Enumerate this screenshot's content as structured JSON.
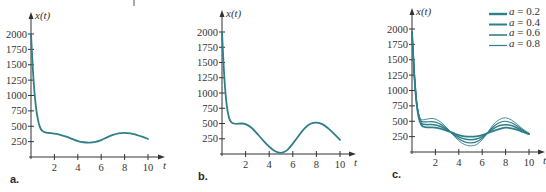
{
  "chart_data": [
    {
      "type": "line",
      "panel_label": "a.",
      "xlabel": "t",
      "ylabel": "x(t)",
      "xticks": [
        2,
        4,
        6,
        8,
        10
      ],
      "yticks": [
        250,
        500,
        750,
        1000,
        1250,
        1500,
        1750,
        2000
      ],
      "xlim": [
        0,
        10
      ],
      "ylim": [
        0,
        2000
      ],
      "grid": false,
      "series": [
        {
          "name": "x(t)",
          "x": [
            0,
            0.2,
            0.4,
            0.6,
            0.8,
            1.0,
            1.3,
            1.6,
            2.0,
            2.5,
            3.0,
            3.5,
            4.0,
            4.5,
            5.0,
            5.5,
            6.0,
            6.5,
            7.0,
            7.5,
            8.0,
            8.5,
            9.0,
            9.5,
            10.0
          ],
          "values": [
            2000,
            1300,
            850,
            600,
            470,
            420,
            395,
            390,
            380,
            360,
            330,
            295,
            260,
            240,
            235,
            245,
            275,
            320,
            360,
            385,
            392,
            385,
            360,
            330,
            295
          ]
        }
      ]
    },
    {
      "type": "line",
      "panel_label": "b.",
      "xlabel": "t",
      "ylabel": "x(t)",
      "xticks": [
        2,
        4,
        6,
        8,
        10
      ],
      "yticks": [
        250,
        500,
        750,
        1000,
        1250,
        1500,
        1750,
        2000
      ],
      "xlim": [
        0,
        10
      ],
      "ylim": [
        0,
        2000
      ],
      "grid": false,
      "series": [
        {
          "name": "x(t)",
          "x": [
            0,
            0.2,
            0.4,
            0.6,
            0.8,
            1.0,
            1.3,
            1.6,
            2.0,
            2.5,
            3.0,
            3.5,
            4.0,
            4.5,
            5.0,
            5.5,
            6.0,
            6.5,
            7.0,
            7.5,
            8.0,
            8.5,
            9.0,
            9.5,
            10.0
          ],
          "values": [
            2000,
            1250,
            800,
            590,
            520,
            500,
            495,
            500,
            490,
            430,
            330,
            220,
            120,
            45,
            20,
            60,
            170,
            300,
            420,
            495,
            515,
            490,
            420,
            330,
            230
          ]
        }
      ]
    },
    {
      "type": "line",
      "panel_label": "c.",
      "xlabel": "t",
      "ylabel": "x(t)",
      "xticks": [
        2,
        4,
        6,
        8,
        10
      ],
      "yticks": [
        250,
        500,
        750,
        1000,
        1250,
        1500,
        1750,
        2000
      ],
      "xlim": [
        0,
        10
      ],
      "ylim": [
        0,
        2000
      ],
      "grid": false,
      "legend_position": "upper right",
      "series": [
        {
          "name": "a = 0.2",
          "x": [
            0,
            0.2,
            0.4,
            0.6,
            0.8,
            1.0,
            1.3,
            1.6,
            2.0,
            2.5,
            3.0,
            3.5,
            4.0,
            4.5,
            5.0,
            5.5,
            6.0,
            6.5,
            7.0,
            7.5,
            8.0,
            8.5,
            9.0,
            9.5,
            10.0
          ],
          "values": [
            1950,
            1250,
            780,
            540,
            440,
            410,
            400,
            400,
            395,
            375,
            345,
            310,
            275,
            255,
            250,
            255,
            275,
            310,
            345,
            375,
            395,
            385,
            360,
            325,
            290
          ]
        },
        {
          "name": "a = 0.4",
          "x": [
            0,
            0.2,
            0.4,
            0.6,
            0.8,
            1.0,
            1.3,
            1.6,
            2.0,
            2.5,
            3.0,
            3.5,
            4.0,
            4.5,
            5.0,
            5.5,
            6.0,
            6.5,
            7.0,
            7.5,
            8.0,
            8.5,
            9.0,
            9.5,
            10.0
          ],
          "values": [
            1950,
            1250,
            790,
            560,
            470,
            450,
            445,
            447,
            440,
            410,
            360,
            300,
            245,
            210,
            200,
            210,
            250,
            315,
            385,
            430,
            445,
            430,
            390,
            340,
            295
          ]
        },
        {
          "name": "a = 0.6",
          "x": [
            0,
            0.2,
            0.4,
            0.6,
            0.8,
            1.0,
            1.3,
            1.6,
            2.0,
            2.5,
            3.0,
            3.5,
            4.0,
            4.5,
            5.0,
            5.5,
            6.0,
            6.5,
            7.0,
            7.5,
            8.0,
            8.5,
            9.0,
            9.5,
            10.0
          ],
          "values": [
            1950,
            1250,
            800,
            580,
            500,
            490,
            490,
            495,
            485,
            445,
            375,
            290,
            215,
            165,
            150,
            165,
            225,
            320,
            420,
            480,
            500,
            475,
            420,
            355,
            300
          ]
        },
        {
          "name": "a = 0.8",
          "x": [
            0,
            0.2,
            0.4,
            0.6,
            0.8,
            1.0,
            1.3,
            1.6,
            2.0,
            2.5,
            3.0,
            3.5,
            4.0,
            4.5,
            5.0,
            5.5,
            6.0,
            6.5,
            7.0,
            7.5,
            8.0,
            8.5,
            9.0,
            9.5,
            10.0
          ],
          "values": [
            1950,
            1250,
            810,
            600,
            530,
            525,
            535,
            545,
            535,
            480,
            390,
            280,
            185,
            120,
            100,
            120,
            200,
            325,
            455,
            530,
            555,
            520,
            450,
            370,
            305
          ]
        }
      ]
    }
  ],
  "panels": [
    {
      "label": "a.",
      "ylabel": "x(t)",
      "xlabel": "t"
    },
    {
      "label": "b.",
      "ylabel": "x(t)",
      "xlabel": "t"
    },
    {
      "label": "c.",
      "ylabel": "x(t)",
      "xlabel": "t"
    }
  ],
  "legend": {
    "items": [
      {
        "var": "a",
        "text": " = 0.2",
        "width": 2.4
      },
      {
        "var": "a",
        "text": " = 0.4",
        "width": 2.0
      },
      {
        "var": "a",
        "text": " = 0.6",
        "width": 1.6
      },
      {
        "var": "a",
        "text": " = 0.8",
        "width": 1.2
      }
    ]
  },
  "colors": {
    "curve": "#2f7f8a",
    "axis": "#333333"
  }
}
